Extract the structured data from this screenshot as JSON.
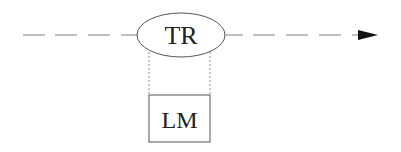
{
  "diagram": {
    "nodes": [
      {
        "id": "tr",
        "label": "TR",
        "shape": "ellipse"
      },
      {
        "id": "lm",
        "label": "LM",
        "shape": "rectangle"
      }
    ],
    "edges": [
      {
        "from": "start",
        "to": "tr",
        "style": "dashed"
      },
      {
        "from": "tr",
        "to": "end",
        "style": "dashed",
        "arrow": true
      },
      {
        "from": "tr",
        "to": "lm",
        "style": "dotted",
        "count": 2
      }
    ],
    "colors": {
      "stroke": "#555555",
      "dash": "#888888",
      "arrow": "#111111",
      "text": "#222222"
    }
  }
}
